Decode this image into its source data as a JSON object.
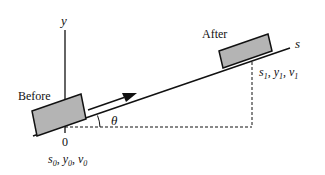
{
  "diagram": {
    "axis": {
      "y_label": "y",
      "s_label": "s",
      "origin_label": "0"
    },
    "angle_label": "θ",
    "before": {
      "label": "Before",
      "state": {
        "s": "s",
        "s_sub": "0",
        "y": "y",
        "y_sub": "0",
        "v": "v",
        "v_sub": "0"
      }
    },
    "after": {
      "label": "After",
      "state": {
        "s": "s",
        "s_sub": "1",
        "y": "y",
        "y_sub": "1",
        "v": "v",
        "v_sub": "1"
      }
    },
    "colors": {
      "line": "#111111",
      "block_fill": "#b4b4b4",
      "background": "#ffffff"
    }
  }
}
